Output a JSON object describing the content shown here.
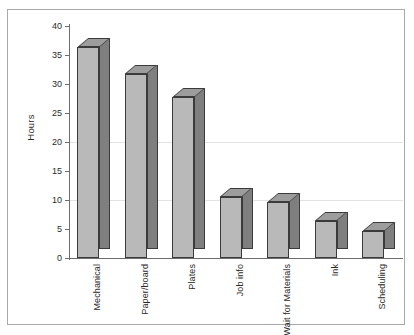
{
  "figure": {
    "cropped_title_remnant": "·",
    "frame": {
      "border_color": "#a9a9a9",
      "background": "#ffffff"
    }
  },
  "chart_data": {
    "type": "bar",
    "title": "",
    "xlabel": "",
    "ylabel": "Hours",
    "categories": [
      "Mechanical",
      "Paper/board",
      "Plates",
      "Job info",
      "Wait for Materials",
      "Ink",
      "Scheduling"
    ],
    "values": [
      36.4,
      31.7,
      27.8,
      10.5,
      9.7,
      6.4,
      4.7
    ],
    "ylim": [
      0,
      40
    ],
    "ytick_labels": [
      "40",
      "35",
      "30",
      "25",
      "20",
      "15",
      "10",
      "5",
      "0"
    ],
    "ytick_values": [
      40,
      35,
      30,
      25,
      20,
      15,
      10,
      5,
      0
    ],
    "grid": true,
    "gridlines_at": [
      20,
      10
    ],
    "legend": "none",
    "style": {
      "bar_front_color": "#b9b9b9",
      "bar_side_color": "#7f7f7f",
      "bar_top_color": "#9d9d9d",
      "bar_outline_color": "#3b3b3b",
      "axis_color": "#6d6d6d",
      "gridline_color": "#e2e2e2",
      "text_color": "#2b2b2b",
      "three_d": true
    }
  }
}
